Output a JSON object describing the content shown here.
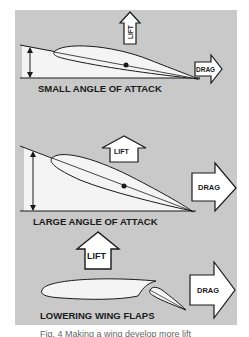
{
  "figure": {
    "panels": [
      {
        "id": "small",
        "title": "SMALL ANGLE OF ATTACK",
        "lift_label": "LIFT",
        "drag_label": "DRAG"
      },
      {
        "id": "large",
        "title": "LARGE ANGLE OF ATTACK",
        "lift_label": "LIFT",
        "drag_label": "DRAG"
      },
      {
        "id": "flaps",
        "title": "LOWERING WING FLAPS",
        "lift_label": "LIFT",
        "drag_label": "DRAG"
      }
    ],
    "caption": "Fig. 4 Making a wing develop more lift"
  },
  "colors": {
    "panel_bg": "#c9c9c9",
    "wing_fill": "#f4f4f4",
    "ink": "#1a1a1a"
  }
}
